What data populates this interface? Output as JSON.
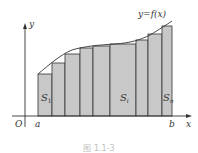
{
  "figure": {
    "curve_label": "y=f(x)",
    "y_axis_label": "y",
    "x_axis_label": "x",
    "origin_label": "O",
    "a_label": "a",
    "b_label": "b",
    "region_labels": {
      "first": "S",
      "first_sub": "1",
      "middle": "S",
      "middle_sub": "i",
      "last": "S",
      "last_sub": "n"
    },
    "caption": "图 1.1-3",
    "colors": {
      "rect_fill": "#c8c8c8",
      "rect_stroke": "#333333",
      "curve": "#333333",
      "axis": "#333333"
    }
  },
  "diagram": {
    "type": "riemann-sum-rectangles",
    "baseline_y": 116,
    "rectangles": [
      {
        "x0": 38,
        "x1": 52,
        "top": 74
      },
      {
        "x0": 52,
        "x1": 65,
        "top": 63
      },
      {
        "x0": 65,
        "x1": 80,
        "top": 54
      },
      {
        "x0": 80,
        "x1": 93,
        "top": 48
      },
      {
        "x0": 93,
        "x1": 110,
        "top": 46
      },
      {
        "x0": 110,
        "x1": 136,
        "top": 44
      },
      {
        "x0": 136,
        "x1": 148,
        "top": 40
      },
      {
        "x0": 148,
        "x1": 162,
        "top": 34
      },
      {
        "x0": 162,
        "x1": 172,
        "top": 26
      }
    ]
  }
}
